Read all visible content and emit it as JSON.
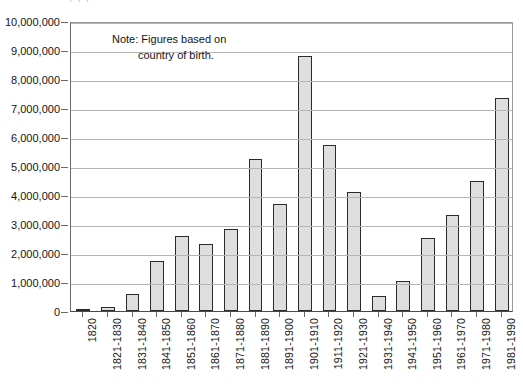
{
  "top_artifact": {
    "text": "' ' '"
  },
  "note": {
    "line1": "Note: Figures based on",
    "line2": "country of birth."
  },
  "colors": {
    "bar_fill": "#dedede",
    "bar_border": "#2b2b2b",
    "gridline": "#b5b5b5",
    "frame": "#8c8c8c",
    "text": "#141414"
  },
  "chart_data": {
    "type": "bar",
    "title": "",
    "subtitle": "",
    "xlabel": "",
    "ylabel": "",
    "ylim": [
      0,
      10000000
    ],
    "grid": true,
    "legend": "none",
    "annotations": [
      "Note: Figures based on country of birth."
    ],
    "ytick_labels": [
      "0",
      "1,000,000",
      "2,000,000",
      "3,000,000",
      "4,000,000",
      "5,000,000",
      "6,000,000",
      "7,000,000",
      "8,000,000",
      "9,000,000",
      "10,000,000"
    ],
    "ytick_values": [
      0,
      1000000,
      2000000,
      3000000,
      4000000,
      5000000,
      6000000,
      7000000,
      8000000,
      9000000,
      10000000
    ],
    "categories": [
      "1820",
      "1821-1830",
      "1831-1840",
      "1841-1850",
      "1851-1860",
      "1861-1870",
      "1871-1880",
      "1881-1890",
      "1891-1900",
      "1901-1910",
      "1911-1920",
      "1921-1930",
      "1931-1940",
      "1941-1950",
      "1951-1960",
      "1961-1970",
      "1971-1980",
      "1981-1990"
    ],
    "values": [
      8400,
      143000,
      600000,
      1713000,
      2598000,
      2315000,
      2812000,
      5247000,
      3688000,
      8795000,
      5736000,
      4107000,
      528000,
      1035000,
      2515000,
      3322000,
      4493000,
      7338000
    ]
  }
}
